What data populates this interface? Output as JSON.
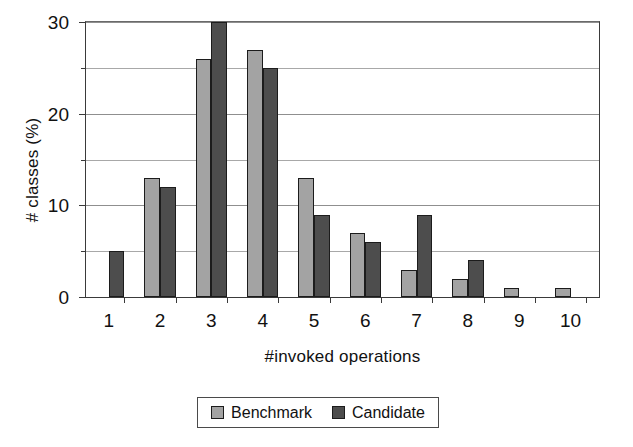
{
  "chart_data": {
    "type": "bar",
    "title": "",
    "subtitle": "",
    "xlabel": "#invoked operations",
    "ylabel": "# classes (%)",
    "categories": [
      "1",
      "2",
      "3",
      "4",
      "5",
      "6",
      "7",
      "8",
      "9",
      "10"
    ],
    "series": [
      {
        "name": "Benchmark",
        "color": "#a3a3a3",
        "values": [
          0,
          13,
          26,
          27,
          13,
          7,
          3,
          2,
          1,
          1
        ]
      },
      {
        "name": "Candidate",
        "color": "#4d4d4d",
        "values": [
          5,
          12,
          30,
          25,
          9,
          6,
          9,
          4,
          0,
          0
        ]
      }
    ],
    "ylim": [
      0,
      30
    ],
    "yticks": [
      0,
      10,
      20,
      30
    ],
    "ytick_labels": [
      "0",
      "10",
      "20",
      "30"
    ],
    "yminor_ticks": [
      5,
      15,
      25
    ],
    "grid": true,
    "grid_axis": "y",
    "legend_position": "bottom",
    "legend_entries": [
      "Benchmark",
      "Candidate"
    ]
  }
}
